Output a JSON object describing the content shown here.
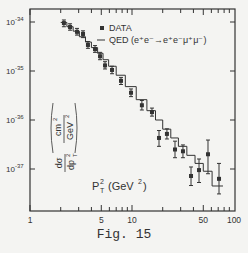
{
  "chart_data": {
    "type": "scatter",
    "title": "",
    "caption": "Fig. 15",
    "xlabel": "P_T^2 (GeV^2)",
    "ylabel": "dσ/dp_T^2 (cm^2/GeV^2)",
    "xscale": "log",
    "yscale": "log",
    "xlim": [
      1,
      100
    ],
    "ylim": [
      4e-38,
      1.6e-34
    ],
    "x_ticks": [
      1,
      5,
      10,
      50,
      100
    ],
    "x_tick_labels": [
      "1",
      "5",
      "10",
      "50",
      "100"
    ],
    "y_ticks": [
      1e-34,
      1e-35,
      1e-36,
      1e-37
    ],
    "y_tick_labels": [
      {
        "base": "10",
        "exp": "-34"
      },
      {
        "base": "10",
        "exp": "-35"
      },
      {
        "base": "10",
        "exp": "-36"
      },
      {
        "base": "10",
        "exp": "-37"
      }
    ],
    "grid": false,
    "legend": {
      "position": "upper right",
      "entries": [
        {
          "marker": "■",
          "label": "DATA"
        },
        {
          "marker": "—",
          "label": "QED (e⁺e⁻→e⁺e⁻μ⁺μ⁻)"
        }
      ]
    },
    "series": [
      {
        "name": "DATA",
        "style": "points with error bars",
        "x": [
          2.15,
          2.47,
          2.89,
          3.31,
          3.7,
          4.34,
          4.86,
          5.44,
          6.37,
          7.8,
          9.78,
          12.5,
          15.7,
          18.4,
          22.0,
          26.4,
          31.6,
          37.9,
          45.4,
          55.6,
          71.3
        ],
        "y": [
          9.5e-35,
          7.9e-35,
          6.3e-35,
          5.7e-35,
          3.4e-35,
          2.8e-35,
          2e-35,
          1.3e-35,
          1.05e-35,
          6.3e-36,
          3.6e-36,
          2e-36,
          1.45e-36,
          4.3e-37,
          5.2e-37,
          2.5e-37,
          2.3e-37,
          7.2e-38,
          9.5e-38,
          2e-37,
          6.3e-38
        ],
        "y_err_low": [
          8e-35,
          6.8e-35,
          5.4e-35,
          4.8e-35,
          2.9e-35,
          2.4e-35,
          1.7e-35,
          1.1e-35,
          8.8e-36,
          5.3e-36,
          3e-36,
          1.6e-36,
          1.2e-36,
          2.9e-37,
          4.1e-37,
          1.7e-37,
          1.7e-37,
          4.6e-38,
          5.3e-38,
          8e-38,
          3.1e-38
        ],
        "y_err_high": [
          1.1e-34,
          9.2e-35,
          7.4e-35,
          6.6e-35,
          4e-35,
          3.3e-35,
          2.4e-35,
          1.55e-35,
          1.25e-35,
          7.4e-36,
          4.3e-36,
          2.5e-36,
          1.75e-36,
          6.1e-37,
          6.6e-37,
          3.7e-37,
          3.1e-37,
          1.1e-37,
          1.6e-37,
          3.9e-37,
          1.3e-37
        ]
      },
      {
        "name": "QED (e⁺e⁻→e⁺e⁻μ⁺μ⁻)",
        "style": "step histogram",
        "bin_edges": [
          2.0,
          2.3,
          2.65,
          3.05,
          3.5,
          4.0,
          4.6,
          5.2,
          5.9,
          7.0,
          8.6,
          11.0,
          14.0,
          17.0,
          20.0,
          24.0,
          28.5,
          34.5,
          41.5,
          50.0,
          61.0,
          78.0
        ],
        "values": [
          9.8e-35,
          8e-35,
          6.5e-35,
          5e-35,
          3.9e-35,
          3e-35,
          2.3e-35,
          1.7e-35,
          1.25e-35,
          8.2e-36,
          4.8e-36,
          2.6e-36,
          1.55e-36,
          1e-36,
          6.5e-37,
          4.3e-37,
          2.9e-37,
          1.9e-37,
          1.3e-37,
          9e-38,
          4.5e-38
        ]
      }
    ]
  },
  "legend_labels": {
    "data": "DATA",
    "qed_prefix": "QED (e",
    "qed_full": "QED (e⁺e⁻→e⁺e⁻μ⁺μ⁻)"
  },
  "axis_labels": {
    "x": "P",
    "x_sub": "T",
    "x_sup": "2",
    "x_unit": "(GeV",
    "x_unit_sup": "2",
    "x_unit_close": ")",
    "y_num": "dσ",
    "y_den": "dp",
    "y_den_sub": "T",
    "y_den_sup": "2",
    "y_unit_num": "cm",
    "y_unit_num_sup": "2",
    "y_unit_den": "GeV",
    "y_unit_den_sup": "2"
  },
  "caption": "Fig. 15"
}
